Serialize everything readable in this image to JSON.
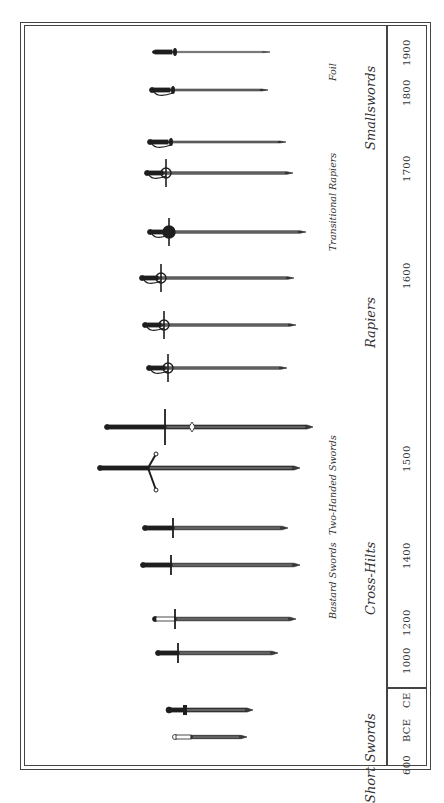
{
  "timeline": {
    "years": [
      {
        "label": "1900",
        "y": 52
      },
      {
        "label": "1800",
        "y": 92
      },
      {
        "label": "1700",
        "y": 168
      },
      {
        "label": "1600",
        "y": 275
      },
      {
        "label": "1500",
        "y": 458
      },
      {
        "label": "1400",
        "y": 555
      },
      {
        "label": "1200",
        "y": 622
      },
      {
        "label": "1000",
        "y": 660
      },
      {
        "label": "CE",
        "y": 700
      },
      {
        "label": "BCE",
        "y": 730
      },
      {
        "label": "600",
        "y": 765
      }
    ]
  },
  "categories": [
    {
      "label": "Smallswords",
      "y": 108
    },
    {
      "label": "Rapiers",
      "y": 322
    },
    {
      "label": "Cross-Hilts",
      "y": 578
    },
    {
      "label": "Short Swords",
      "y": 758
    }
  ],
  "subcategories": [
    {
      "label": "Foil",
      "y": 72
    },
    {
      "label": "Transitional Rapiers",
      "y": 202
    },
    {
      "label": "Two-Handed Swords",
      "y": 485
    },
    {
      "label": "Bastard Swords",
      "y": 580
    }
  ],
  "swords": [
    {
      "name": "foil",
      "type": "foil",
      "y": 52,
      "x1": 152,
      "x2": 270
    },
    {
      "name": "smallsword",
      "type": "smallsword",
      "y": 90,
      "x1": 150,
      "x2": 268
    },
    {
      "name": "transitional-rapier-1",
      "type": "smallsword",
      "y": 142,
      "x1": 148,
      "x2": 286
    },
    {
      "name": "transitional-rapier-2",
      "type": "rapier",
      "y": 173,
      "x1": 145,
      "x2": 293
    },
    {
      "name": "rapier-1",
      "type": "cuprapier",
      "y": 232,
      "x1": 148,
      "x2": 306
    },
    {
      "name": "rapier-2",
      "type": "rapier",
      "y": 278,
      "x1": 140,
      "x2": 294
    },
    {
      "name": "rapier-3",
      "type": "rapier",
      "y": 325,
      "x1": 143,
      "x2": 296
    },
    {
      "name": "rapier-4",
      "type": "rapier",
      "y": 368,
      "x1": 147,
      "x2": 287
    },
    {
      "name": "two-handed-sword-1",
      "type": "twohand",
      "y": 427,
      "x1": 105,
      "x2": 313
    },
    {
      "name": "two-handed-sword-2",
      "type": "claymore",
      "y": 468,
      "x1": 98,
      "x2": 300
    },
    {
      "name": "bastard-sword-1",
      "type": "bastard",
      "y": 528,
      "x1": 143,
      "x2": 288
    },
    {
      "name": "bastard-sword-2",
      "type": "bastard",
      "y": 565,
      "x1": 141,
      "x2": 300
    },
    {
      "name": "cross-hilt-1",
      "type": "cross",
      "y": 619,
      "x1": 153,
      "x2": 296
    },
    {
      "name": "cross-hilt-2",
      "type": "cross",
      "y": 653,
      "x1": 156,
      "x2": 278
    },
    {
      "name": "short-sword-1",
      "type": "gladius",
      "y": 710,
      "x1": 167,
      "x2": 253
    },
    {
      "name": "short-sword-2",
      "type": "xiphos",
      "y": 737,
      "x1": 173,
      "x2": 247
    }
  ]
}
